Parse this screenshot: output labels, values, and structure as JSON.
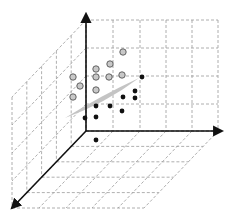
{
  "figure": {
    "type": "3d-scatter-with-separating-plane",
    "colors": {
      "grid": "#9a9a9a",
      "axis": "#111111",
      "class_a_fill": "#c8c8c8",
      "class_a_stroke": "#555555",
      "class_b_fill": "#111111",
      "plane": "#c4c4c4"
    }
  },
  "chart_data": {
    "type": "scatter",
    "title": "",
    "xlabel": "",
    "ylabel": "",
    "zlabel": "",
    "grid": true,
    "legend": [],
    "series": [
      {
        "name": "class-a (open gray circles)",
        "points_px": [
          [
            73,
            77
          ],
          [
            80,
            86
          ],
          [
            73,
            97
          ],
          [
            96,
            69
          ],
          [
            96,
            77
          ],
          [
            96,
            90
          ],
          [
            110,
            64
          ],
          [
            109,
            77
          ],
          [
            123,
            52
          ],
          [
            122,
            75
          ]
        ]
      },
      {
        "name": "class-b (filled black dots)",
        "points_px": [
          [
            142,
            77
          ],
          [
            135,
            91
          ],
          [
            135,
            98
          ],
          [
            123,
            97
          ],
          [
            96,
            106
          ],
          [
            110,
            106
          ],
          [
            122,
            111
          ],
          [
            85,
            118
          ],
          [
            96,
            117
          ],
          [
            96,
            140
          ]
        ]
      }
    ],
    "separating_plane": {
      "from_px": [
        65,
        118
      ],
      "to_px": [
        139,
        78
      ]
    }
  }
}
